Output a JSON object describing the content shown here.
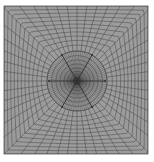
{
  "figure": {
    "type": "structured-mesh",
    "box": {
      "x": 4,
      "y": 6,
      "width": 144,
      "height": 148
    },
    "center": {
      "x": 77,
      "y": 81
    },
    "colors": {
      "background": "#ffffff",
      "mesh_fill": "#9c9c9c",
      "mesh_line": "#4a4a4a",
      "dense_line": "#3a3a3a",
      "border": "#555555"
    },
    "radial_spokes": 48,
    "outer_rings": 11,
    "inner_circle_radius": 30,
    "inner_rings": 9,
    "highlight_spokes": [
      {
        "angle": 0,
        "length": 28
      },
      {
        "angle": 60,
        "length": 30
      },
      {
        "angle": 120,
        "length": 30
      },
      {
        "angle": 180,
        "length": 28
      },
      {
        "angle": 240,
        "length": 30
      },
      {
        "angle": 300,
        "length": 30
      }
    ]
  },
  "caption": {
    "text": ""
  }
}
